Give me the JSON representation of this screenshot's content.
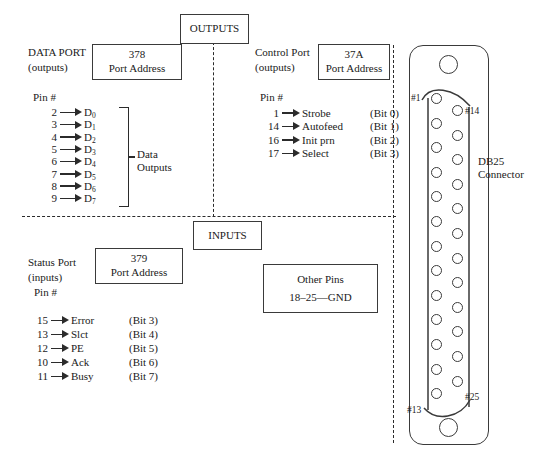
{
  "diagram": {
    "section_labels": {
      "outputs": "OUTPUTS",
      "inputs": "INPUTS"
    },
    "data_port": {
      "name": "DATA PORT",
      "direction": "(outputs)",
      "address": "378",
      "address_caption": "Port Address",
      "pin_header": "Pin #",
      "group_label_line1": "Data",
      "group_label_line2": "Outputs",
      "pins": [
        {
          "pin": "2",
          "signal": "D",
          "sub": "0"
        },
        {
          "pin": "3",
          "signal": "D",
          "sub": "1"
        },
        {
          "pin": "4",
          "signal": "D",
          "sub": "2"
        },
        {
          "pin": "5",
          "signal": "D",
          "sub": "3"
        },
        {
          "pin": "6",
          "signal": "D",
          "sub": "4"
        },
        {
          "pin": "7",
          "signal": "D",
          "sub": "5"
        },
        {
          "pin": "8",
          "signal": "D",
          "sub": "6"
        },
        {
          "pin": "9",
          "signal": "D",
          "sub": "7"
        }
      ]
    },
    "control_port": {
      "name": "Control Port",
      "direction": "(outputs)",
      "address": "37A",
      "address_caption": "Port Address",
      "pin_header": "Pin #",
      "pins": [
        {
          "pin": "1",
          "signal": "Strobe",
          "bit": "(Bit 0)"
        },
        {
          "pin": "14",
          "signal": "Autofeed",
          "bit": "(Bit 1)"
        },
        {
          "pin": "16",
          "signal": "Init prn",
          "bit": "(Bit 2)"
        },
        {
          "pin": "17",
          "signal": "Select",
          "bit": "(Bit 3)"
        }
      ]
    },
    "status_port": {
      "name": "Status Port",
      "direction": "(inputs)",
      "address": "379",
      "address_caption": "Port Address",
      "pin_header": "Pin #",
      "pins": [
        {
          "pin": "15",
          "signal": "Error",
          "bit": "(Bit 3)"
        },
        {
          "pin": "13",
          "signal": "Slct",
          "bit": "(Bit 4)"
        },
        {
          "pin": "12",
          "signal": "PE",
          "bit": "(Bit 5)"
        },
        {
          "pin": "10",
          "signal": "Ack",
          "bit": "(Bit 6)"
        },
        {
          "pin": "11",
          "signal": "Busy",
          "bit": "(Bit 7)"
        }
      ]
    },
    "other_pins": {
      "title": "Other Pins",
      "detail": "18–25—GND"
    },
    "connector": {
      "label_line1": "DB25",
      "label_line2": "Connector",
      "pin1_label": "#1",
      "pin13_label": "#13",
      "pin14_label": "#14",
      "pin25_label": "#25",
      "left_column_pin_count": 13,
      "right_column_pin_count": 12
    }
  },
  "colors": {
    "ink": "#1a1a1a",
    "stroke": "#3a3a3a",
    "dash": "#2b2b2b",
    "background": "#ffffff"
  }
}
